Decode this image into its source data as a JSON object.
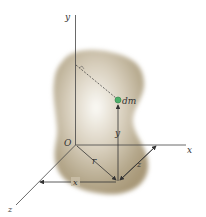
{
  "diagram": {
    "labels": {
      "y_axis": "y",
      "x_axis": "x",
      "z_axis": "z",
      "origin": "O",
      "mass_element": "dm",
      "radius": "r",
      "dim_x": "x",
      "dim_y": "y",
      "dim_z": "z"
    },
    "colors": {
      "body_center": "#f4f1ea",
      "body_edge": "#a89878",
      "mass_element": "#4caf6a",
      "lines": "#333333"
    }
  }
}
